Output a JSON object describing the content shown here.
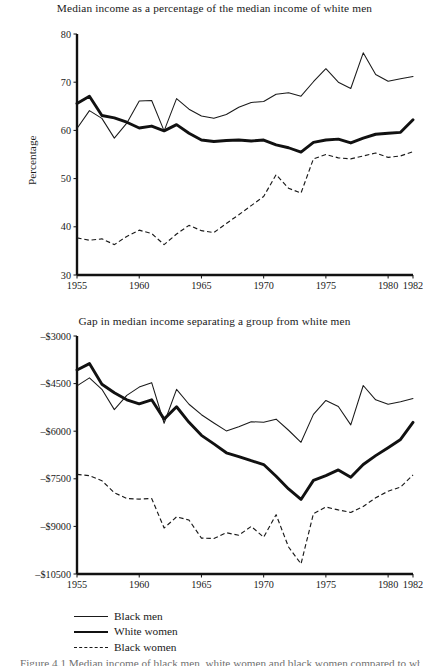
{
  "figure": {
    "legend": [
      {
        "label": "Black men",
        "style": "thin"
      },
      {
        "label": "White women",
        "style": "thick"
      },
      {
        "label": "Black women",
        "style": "dashed"
      }
    ],
    "caption": "Figure 4.1   Median income of black men, white women and black women compared to white men"
  },
  "chart_data": [
    {
      "type": "line",
      "panel": "top",
      "title": "Median income as a percentage of the median income of white men",
      "xlabel": "",
      "ylabel": "Percentage",
      "xlim": [
        1955,
        1982
      ],
      "ylim": [
        30,
        80
      ],
      "xticks": [
        1955,
        1960,
        1965,
        1970,
        1975,
        1980,
        1982
      ],
      "xtick_labels": [
        "1955",
        "1960",
        "1965",
        "1970",
        "1975",
        "1980",
        "1982"
      ],
      "yticks": [
        30,
        40,
        50,
        60,
        70,
        80
      ],
      "ytick_labels": [
        "30",
        "40",
        "50",
        "60",
        "70",
        "80"
      ],
      "grid": false,
      "legend_position": "below-figure",
      "x": [
        1955,
        1956,
        1957,
        1958,
        1959,
        1960,
        1961,
        1962,
        1963,
        1964,
        1965,
        1966,
        1967,
        1968,
        1969,
        1970,
        1971,
        1972,
        1973,
        1974,
        1975,
        1976,
        1977,
        1978,
        1979,
        1980,
        1981,
        1982
      ],
      "series": [
        {
          "name": "Black men",
          "style": "thin",
          "values": [
            60.4,
            64.1,
            62.5,
            58.4,
            61.5,
            66.1,
            66.2,
            59.9,
            66.6,
            64.4,
            63.0,
            62.5,
            63.3,
            64.8,
            65.8,
            66.0,
            67.5,
            67.8,
            67.1,
            70.1,
            72.8,
            70.0,
            68.7,
            76.1,
            71.6,
            70.2,
            70.7,
            71.2
          ]
        },
        {
          "name": "White women",
          "style": "thick",
          "values": [
            65.6,
            67.1,
            63.1,
            62.6,
            61.7,
            60.5,
            60.9,
            59.9,
            61.2,
            59.4,
            58.0,
            57.7,
            57.9,
            58.0,
            57.8,
            58.0,
            57.0,
            56.4,
            55.5,
            57.5,
            58.0,
            58.2,
            57.4,
            58.4,
            59.2,
            59.4,
            59.6,
            62.2
          ]
        },
        {
          "name": "Black women",
          "style": "dashed",
          "values": [
            37.7,
            37.2,
            37.5,
            36.3,
            38.0,
            39.3,
            38.6,
            36.3,
            38.5,
            40.3,
            39.2,
            38.8,
            40.7,
            42.5,
            44.4,
            46.3,
            50.8,
            48.0,
            47.0,
            54.1,
            55.0,
            54.3,
            54.1,
            54.7,
            55.3,
            54.4,
            54.7,
            55.6
          ]
        }
      ]
    },
    {
      "type": "line",
      "panel": "bottom",
      "title": "Gap in median income separating a group from white men",
      "xlabel": "",
      "ylabel": "Difference in median income",
      "xlim": [
        1955,
        1982
      ],
      "ylim": [
        -10500,
        -3000
      ],
      "xticks": [
        1955,
        1960,
        1965,
        1970,
        1975,
        1980,
        1982
      ],
      "xtick_labels": [
        "1955",
        "1960",
        "1965",
        "1970",
        "1975",
        "1980",
        "1982"
      ],
      "yticks": [
        -10500,
        -9000,
        -7500,
        -6000,
        -4500,
        -3000
      ],
      "ytick_labels": [
        "-$10500",
        "-$9000",
        "-$7500",
        "-$6000",
        "-$4500",
        "-$3000"
      ],
      "grid": false,
      "legend_position": "below-figure",
      "x": [
        1955,
        1956,
        1957,
        1958,
        1959,
        1960,
        1961,
        1962,
        1963,
        1964,
        1965,
        1966,
        1967,
        1968,
        1969,
        1970,
        1971,
        1972,
        1973,
        1974,
        1975,
        1976,
        1977,
        1978,
        1979,
        1980,
        1981,
        1982
      ],
      "series": [
        {
          "name": "Black men",
          "style": "thin",
          "values": [
            -4570,
            -4320,
            -4680,
            -5320,
            -4870,
            -4610,
            -4470,
            -5750,
            -4680,
            -5150,
            -5480,
            -5740,
            -5990,
            -5860,
            -5700,
            -5720,
            -5620,
            -5970,
            -6350,
            -5470,
            -5030,
            -5220,
            -5800,
            -4560,
            -5010,
            -5150,
            -5070,
            -4970
          ]
        },
        {
          "name": "White women",
          "style": "thick",
          "values": [
            -4070,
            -3870,
            -4520,
            -4790,
            -5010,
            -5140,
            -5010,
            -5620,
            -5230,
            -5720,
            -6130,
            -6400,
            -6680,
            -6800,
            -6930,
            -7050,
            -7420,
            -7820,
            -8150,
            -7550,
            -7400,
            -7220,
            -7450,
            -7050,
            -6770,
            -6520,
            -6260,
            -5720
          ]
        },
        {
          "name": "Black women",
          "style": "dashed",
          "values": [
            -7360,
            -7400,
            -7560,
            -7940,
            -8120,
            -8140,
            -8120,
            -9050,
            -8700,
            -8800,
            -9370,
            -9380,
            -9200,
            -9280,
            -9000,
            -9340,
            -8630,
            -9650,
            -10180,
            -8600,
            -8390,
            -8480,
            -8560,
            -8370,
            -8100,
            -7890,
            -7760,
            -7380
          ]
        }
      ]
    }
  ]
}
